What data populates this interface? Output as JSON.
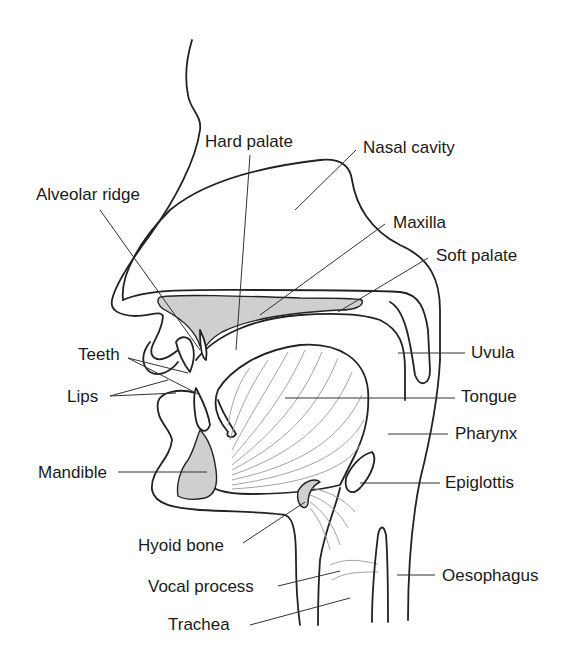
{
  "diagram": {
    "colors": {
      "outline": "#222222",
      "bone_fill": "#cfcfcf",
      "muscle_lines": "#9a9a9a",
      "background": "#ffffff"
    },
    "labels": {
      "hard_palate": "Hard palate",
      "nasal_cavity": "Nasal cavity",
      "alveolar_ridge": "Alveolar ridge",
      "maxilla": "Maxilla",
      "soft_palate": "Soft palate",
      "teeth": "Teeth",
      "lips": "Lips",
      "uvula": "Uvula",
      "tongue": "Tongue",
      "pharynx": "Pharynx",
      "mandible": "Mandible",
      "epiglottis": "Epiglottis",
      "hyoid_bone": "Hyoid bone",
      "vocal_process": "Vocal process",
      "oesophagus": "Oesophagus",
      "trachea": "Trachea"
    }
  }
}
